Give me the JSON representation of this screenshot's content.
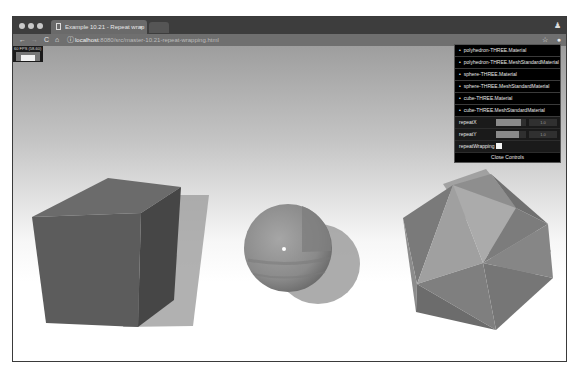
{
  "browser": {
    "tab_title": "Example 10.21 - Repeat wrap",
    "tab_close": "×",
    "url_host": "localhost",
    "url_path": ":8080/src/master-10.21-repeat-wrapping.html",
    "nav": {
      "back": "←",
      "forward": "→",
      "reload": "C",
      "home": "⌂",
      "info": "ⓘ",
      "bookmark": "☆",
      "extension": "●",
      "profile": "♟"
    }
  },
  "stats": {
    "label": "60 FPS (58-60)"
  },
  "controls": {
    "folders": [
      {
        "label": "polyhedron-THREE.Material"
      },
      {
        "label": "polyhedron-THREE.MeshStandardMaterial"
      },
      {
        "label": "sphere-THREE.Material"
      },
      {
        "label": "sphere-THREE.MeshStandardMaterial"
      },
      {
        "label": "cube-THREE.Material"
      },
      {
        "label": "cube-THREE.MeshStandardMaterial"
      }
    ],
    "bullet": "•",
    "repeatX": {
      "label": "repeatX",
      "value": "1.0",
      "fill_pct": 82
    },
    "repeatY": {
      "label": "repeatY",
      "value": "1.0",
      "fill_pct": 75
    },
    "repeatWrapping": {
      "label": "repeatWrapping",
      "checked": false
    },
    "close_label": "Close Controls"
  },
  "scene": {
    "objects": [
      "cube",
      "sphere",
      "polyhedron"
    ],
    "colors": {
      "cube_front": "#5e5e5e",
      "cube_top": "#6a6a6a",
      "cube_side": "#4a4a4a",
      "sphere": "#8c8c8c",
      "poly_light": "#a8a8a8",
      "poly_mid": "#8a8a8a",
      "poly_dark": "#6e6e6e"
    }
  }
}
